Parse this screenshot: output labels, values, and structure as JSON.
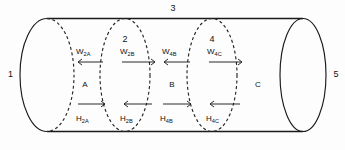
{
  "figure": {
    "type": "cylinder-compartment-diagram",
    "stroke_color": "#1a1a1a",
    "background_color": "#ffffff"
  },
  "boundaries": [
    {
      "id": "b1",
      "label": "1",
      "kind": "end-cap-left",
      "style": "half-solid-half-dashed",
      "x": 47,
      "label_x": 8,
      "label_y": 77
    },
    {
      "id": "b2",
      "label": "2",
      "kind": "internal",
      "style": "dashed",
      "x": 125,
      "label_x": 122,
      "label_y": 42
    },
    {
      "id": "b3",
      "label": "3",
      "kind": "wall-top",
      "style": "solid",
      "x": 173,
      "label_x": 170,
      "label_y": 11
    },
    {
      "id": "b4",
      "label": "4",
      "kind": "internal",
      "style": "dashed",
      "x": 212,
      "label_x": 209,
      "label_y": 42
    },
    {
      "id": "b5",
      "label": "5",
      "kind": "end-cap-right",
      "style": "solid",
      "x": 303,
      "label_x": 333,
      "label_y": 77
    }
  ],
  "regions": [
    {
      "id": "A",
      "label": "A",
      "label_x": 85,
      "label_y": 87
    },
    {
      "id": "B",
      "label": "B",
      "label_x": 172,
      "label_y": 87
    },
    {
      "id": "C",
      "label": "C",
      "label_x": 258,
      "label_y": 87
    }
  ],
  "work_arrows": [
    {
      "id": "w2a",
      "symbol": "W",
      "subscript": "2A",
      "direction": "left",
      "label_x": 82,
      "label_y": 54,
      "arrow_x1": 78,
      "arrow_x2": 103,
      "arrow_y": 62
    },
    {
      "id": "w2b",
      "symbol": "W",
      "subscript": "2B",
      "direction": "right",
      "label_x": 126,
      "label_y": 54,
      "arrow_x1": 122,
      "arrow_x2": 155,
      "arrow_y": 62
    },
    {
      "id": "w4b",
      "symbol": "W",
      "subscript": "4B",
      "direction": "left",
      "label_x": 168,
      "label_y": 54,
      "arrow_x1": 164,
      "arrow_x2": 190,
      "arrow_y": 62
    },
    {
      "id": "w4c",
      "symbol": "W",
      "subscript": "4C",
      "direction": "right",
      "label_x": 213,
      "label_y": 54,
      "arrow_x1": 209,
      "arrow_x2": 242,
      "arrow_y": 62
    }
  ],
  "heat_arrows": [
    {
      "id": "h2a",
      "symbol": "H",
      "subscript": "2A",
      "direction": "right",
      "label_x": 82,
      "label_y": 121,
      "arrow_x1": 78,
      "arrow_x2": 105,
      "arrow_y": 104
    },
    {
      "id": "h2b",
      "symbol": "H",
      "subscript": "2B",
      "direction": "left",
      "label_x": 126,
      "label_y": 121,
      "arrow_x1": 124,
      "arrow_x2": 152,
      "arrow_y": 104
    },
    {
      "id": "h4b",
      "symbol": "H",
      "subscript": "4B",
      "direction": "right",
      "label_x": 166,
      "label_y": 121,
      "arrow_x1": 163,
      "arrow_x2": 191,
      "arrow_y": 104
    },
    {
      "id": "h4c",
      "symbol": "H",
      "subscript": "4C",
      "direction": "left",
      "label_x": 212,
      "label_y": 121,
      "arrow_x1": 210,
      "arrow_x2": 240,
      "arrow_y": 104
    }
  ]
}
